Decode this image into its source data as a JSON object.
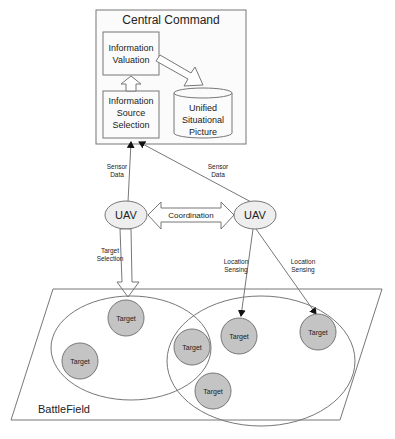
{
  "central_command": {
    "title": "Central Command",
    "valuation": [
      "Information",
      "Valuation"
    ],
    "source_selection": [
      "Information",
      "Source",
      "Selection"
    ],
    "picture": [
      "Unified",
      "Situational",
      "Picture"
    ]
  },
  "links": {
    "sensor_data_left": [
      "Sensor",
      "Data"
    ],
    "sensor_data_right": [
      "Sensor",
      "Data"
    ],
    "coordination": "Coordination",
    "target_selection": [
      "Target",
      "Selection"
    ],
    "location_sensing_1": [
      "Location",
      "Sensing"
    ],
    "location_sensing_2": [
      "Location",
      "Sensing"
    ]
  },
  "uavs": [
    {
      "label": "UAV"
    },
    {
      "label": "UAV"
    }
  ],
  "battlefield": {
    "label": "BattleField",
    "targets": [
      "Target",
      "Target",
      "Target",
      "Target",
      "Target",
      "Target"
    ]
  },
  "colors": {
    "line": "#555555",
    "box_fill": "#f7f7f7",
    "uav_fill": "#eeeeee",
    "target_fill": "#c0c0c0"
  }
}
